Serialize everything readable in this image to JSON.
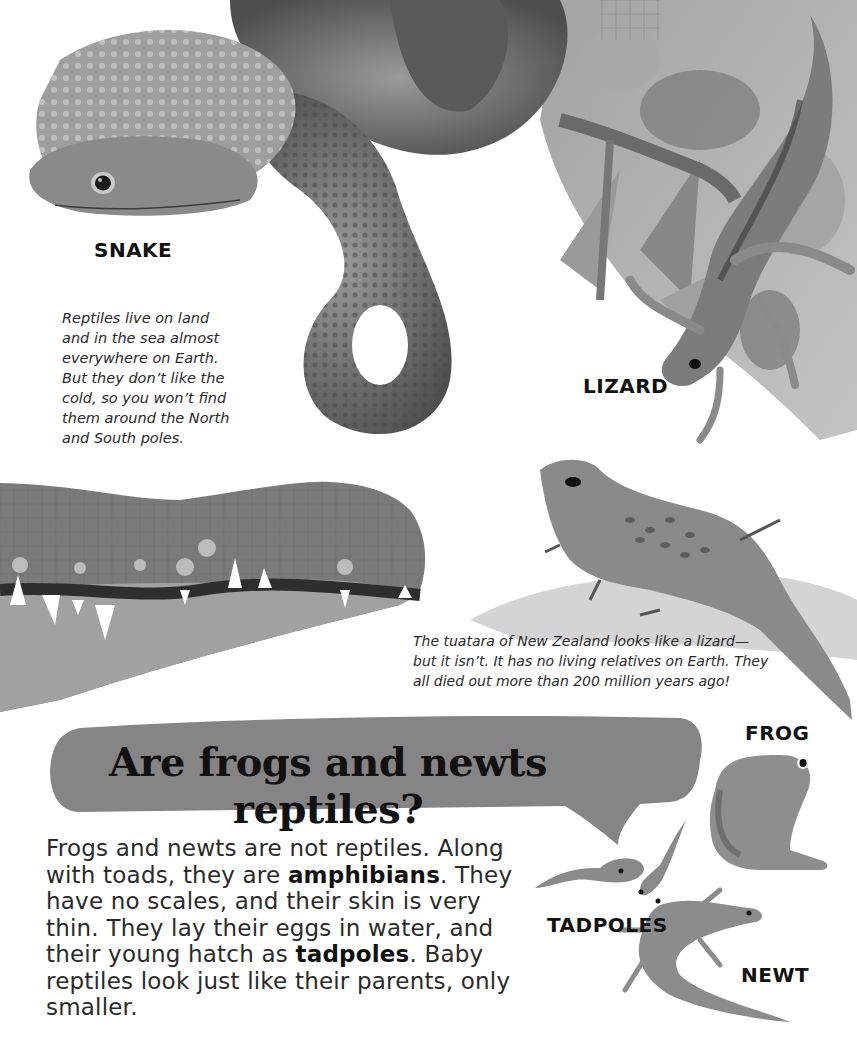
{
  "labels": {
    "snake": "SNAKE",
    "lizard": "LIZARD",
    "frog": "FROG",
    "tadpoles": "TADPOLES",
    "newt": "NEWT"
  },
  "captions": {
    "reptile_habitat": [
      "Reptiles live on land",
      "and in the sea almost",
      "everywhere on Earth.",
      "But they don’t like the",
      "cold, so you won’t find",
      "them around the North",
      "and South poles."
    ],
    "tuatara": [
      "The tuatara of New Zealand looks like a lizard—",
      "but it isn’t. It has no living relatives on Earth. They",
      "all died out more than 200 million years ago!"
    ]
  },
  "heading": {
    "question": "Are frogs and newts reptiles?"
  },
  "body": {
    "p1_a": "Frogs and newts are not reptiles. Along with toads, they are ",
    "p1_bold1": "amphibians",
    "p1_b": ". They have no scales, and their skin is very thin. They lay their eggs in water, and their young hatch as ",
    "p1_bold2": "tadpoles",
    "p1_c": ". Baby reptiles look just like their parents, only smaller."
  },
  "illustrations": {
    "snake": "snake-illustration",
    "lizard": "lizard-illustration",
    "crocodile": "crocodile-jaw-illustration",
    "tuatara": "tuatara-illustration",
    "frog": "frog-illustration",
    "tadpoles": "tadpoles-illustration",
    "newt": "newt-illustration"
  },
  "colors": {
    "bubble": "#858585",
    "text": "#1e1e1e",
    "background": "#ffffff"
  }
}
